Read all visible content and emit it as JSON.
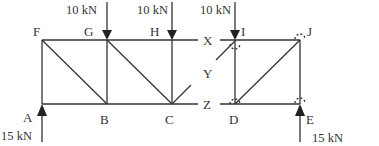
{
  "diagram": {
    "type": "truss",
    "left_truss": {
      "nodes": [
        {
          "id": "F",
          "label": "F"
        },
        {
          "id": "G",
          "label": "G"
        },
        {
          "id": "H",
          "label": "H"
        },
        {
          "id": "A",
          "label": "A"
        },
        {
          "id": "B",
          "label": "B"
        },
        {
          "id": "C",
          "label": "C"
        }
      ]
    },
    "section_labels": {
      "x": "X",
      "y": "Y",
      "z": "Z"
    },
    "right_truss": {
      "nodes": [
        {
          "id": "I",
          "label": "I"
        },
        {
          "id": "J",
          "label": "J"
        },
        {
          "id": "D",
          "label": "D"
        },
        {
          "id": "E",
          "label": "E"
        }
      ]
    },
    "loads": [
      {
        "at": "G",
        "label": "10 kN",
        "direction": "down"
      },
      {
        "at": "H",
        "label": "10 kN",
        "direction": "down"
      },
      {
        "at": "I",
        "label": "10 kN",
        "direction": "down"
      }
    ],
    "reactions": [
      {
        "at": "A",
        "label": "15 kN",
        "direction": "up"
      },
      {
        "at": "E",
        "label": "15 kN",
        "direction": "up"
      }
    ],
    "colors": {
      "line": "#333333",
      "background": "#ffffff"
    }
  }
}
